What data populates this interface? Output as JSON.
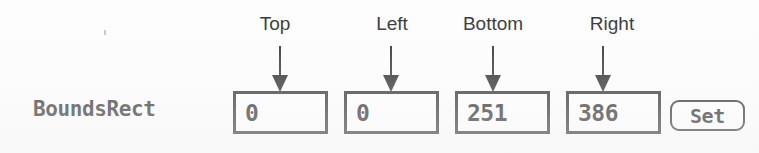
{
  "panel": {
    "row_label": "BoundsRect"
  },
  "captions": [
    {
      "text": "Top"
    },
    {
      "text": "Left"
    },
    {
      "text": "Bottom"
    },
    {
      "text": "Right"
    }
  ],
  "fields": [
    {
      "name": "top",
      "value": "0"
    },
    {
      "name": "left",
      "value": "0"
    },
    {
      "name": "bottom",
      "value": "251"
    },
    {
      "name": "right",
      "value": "386"
    }
  ],
  "button": {
    "label": "Set"
  },
  "colors": {
    "ink": "#1a1a1a",
    "paper": "#fdfdfd"
  }
}
